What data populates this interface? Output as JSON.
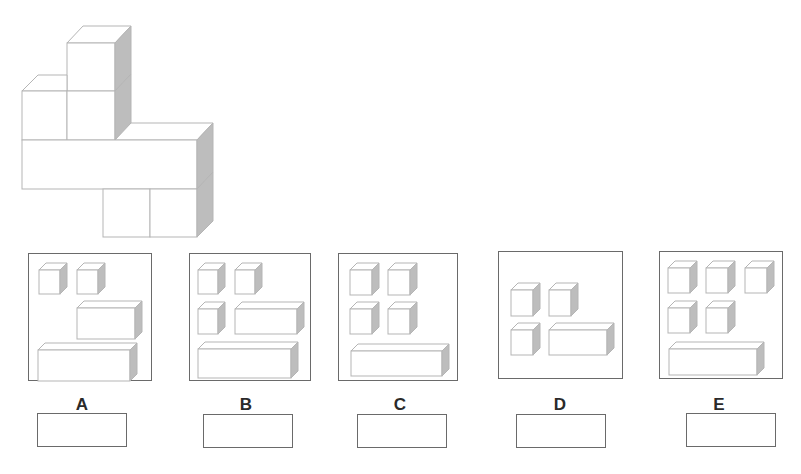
{
  "colors": {
    "edge": "#b5b5b5",
    "shade": "#bdbdbd",
    "border": "#6a6a6a",
    "label": "#2a2a2a"
  },
  "target_shape": {
    "description": "3D assembly of unit cubes: one cube stacked on top, a row of two cubes, a long 4-unit bar, and two cubes below on the right"
  },
  "options": [
    {
      "label": "A",
      "pieces": [
        "1x1 cube",
        "1x1 cube",
        "1x3 bar",
        "1x4 bar"
      ],
      "answer": ""
    },
    {
      "label": "B",
      "pieces": [
        "1x1 cube",
        "1x1 cube",
        "1x1 cube",
        "1x3 bar",
        "1x4 bar"
      ],
      "answer": ""
    },
    {
      "label": "C",
      "pieces": [
        "1x1 cube",
        "1x1 cube",
        "1x1 cube",
        "1x1 cube",
        "1x4 bar"
      ],
      "answer": ""
    },
    {
      "label": "D",
      "pieces": [
        "1x1 cube",
        "1x1 cube",
        "1x1 cube",
        "1x3 bar"
      ],
      "answer": ""
    },
    {
      "label": "E",
      "pieces": [
        "1x1 cube",
        "1x1 cube",
        "1x1 cube",
        "1x1 cube",
        "1x1 cube",
        "1x4 bar"
      ],
      "answer": ""
    }
  ]
}
